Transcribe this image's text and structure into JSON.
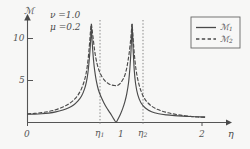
{
  "figure": {
    "background_color": "#f7f7f6",
    "ink_color": "#4a4a4a"
  },
  "annotations": {
    "param_nu": "ν =1.0",
    "param_mu": "μ =0.2"
  },
  "axes": {
    "y_axis_label": "ℳ",
    "x_axis_label": "η",
    "x_tick_labels": [
      "0",
      "η",
      "1",
      "η",
      "2"
    ],
    "x_tick_subs": [
      "",
      "1",
      "",
      "2",
      ""
    ],
    "y_tick_labels": [
      "5",
      "10"
    ]
  },
  "legend": {
    "entries": [
      {
        "label": "ℳ",
        "sub": "1",
        "style": "solid"
      },
      {
        "label": "ℳ",
        "sub": "2",
        "style": "dashed"
      }
    ]
  },
  "chart_data": {
    "type": "line",
    "title": "",
    "xlabel": "η",
    "ylabel": "ℳ",
    "xlim": [
      0,
      2.15
    ],
    "ylim": [
      0,
      13.5
    ],
    "grid": false,
    "legend_position": "top-right",
    "parameters": {
      "nu": 1.0,
      "mu": 0.2
    },
    "x_ticks": [
      {
        "value": 0,
        "label": "0"
      },
      {
        "value": 0.72,
        "label": "η₁"
      },
      {
        "value": 1.0,
        "label": "1"
      },
      {
        "value": 1.18,
        "label": "η₂"
      },
      {
        "value": 2.0,
        "label": "2"
      }
    ],
    "y_ticks": [
      {
        "value": 5,
        "label": "5"
      },
      {
        "value": 10,
        "label": "10"
      }
    ],
    "resonance_lines": [
      {
        "name": "eta1",
        "x": 0.72,
        "style": "dotted"
      },
      {
        "name": "eta2",
        "x": 1.18,
        "style": "dotted"
      }
    ],
    "annotations": [
      {
        "text": "ν =1.0",
        "x": 0.22,
        "y": 12.4
      },
      {
        "text": "μ =0.2",
        "x": 0.22,
        "y": 11.2
      }
    ],
    "series": [
      {
        "name": "ℳ1",
        "style": "solid",
        "x": [
          0.0,
          0.08,
          0.16,
          0.24,
          0.32,
          0.4,
          0.46,
          0.52,
          0.57,
          0.61,
          0.645,
          0.665,
          0.682,
          0.695,
          0.705,
          0.712,
          0.717,
          0.72,
          0.723,
          0.728,
          0.735,
          0.745,
          0.758,
          0.775,
          0.8,
          0.83,
          0.86,
          0.89,
          0.92,
          0.95,
          0.975,
          1.0,
          1.025,
          1.05,
          1.075,
          1.1,
          1.12,
          1.14,
          1.155,
          1.168,
          1.176,
          1.18,
          1.185,
          1.193,
          1.205,
          1.22,
          1.245,
          1.28,
          1.33,
          1.4,
          1.48,
          1.57,
          1.66,
          1.75,
          1.84,
          1.92,
          2.0
        ],
        "y": [
          1.1,
          1.12,
          1.17,
          1.26,
          1.42,
          1.68,
          1.95,
          2.35,
          2.9,
          3.55,
          4.55,
          5.45,
          6.7,
          8.2,
          9.6,
          11.0,
          12.2,
          13.2,
          12.4,
          11.2,
          9.9,
          8.4,
          7.0,
          5.7,
          4.4,
          3.45,
          2.7,
          2.05,
          1.5,
          0.95,
          0.45,
          0.05,
          0.55,
          1.15,
          1.9,
          2.85,
          3.85,
          5.3,
          7.2,
          9.6,
          11.8,
          13.2,
          12.0,
          9.6,
          7.0,
          5.2,
          3.7,
          2.65,
          1.95,
          1.45,
          1.18,
          1.02,
          0.92,
          0.85,
          0.8,
          0.77,
          0.75
        ]
      },
      {
        "name": "ℳ2",
        "style": "dashed",
        "x": [
          0.0,
          0.08,
          0.16,
          0.24,
          0.32,
          0.4,
          0.46,
          0.52,
          0.57,
          0.61,
          0.64,
          0.66,
          0.675,
          0.688,
          0.698,
          0.706,
          0.712,
          0.72,
          0.728,
          0.738,
          0.75,
          0.765,
          0.785,
          0.81,
          0.84,
          0.875,
          0.91,
          0.945,
          0.975,
          1.0,
          1.025,
          1.05,
          1.078,
          1.1,
          1.118,
          1.132,
          1.145,
          1.157,
          1.167,
          1.175,
          1.18,
          1.186,
          1.195,
          1.208,
          1.225,
          1.25,
          1.285,
          1.33,
          1.4,
          1.48,
          1.57,
          1.66,
          1.75,
          1.84,
          1.92,
          2.0
        ],
        "y": [
          1.18,
          1.22,
          1.32,
          1.48,
          1.72,
          2.08,
          2.45,
          3.0,
          3.7,
          4.55,
          5.55,
          6.5,
          7.6,
          8.95,
          10.3,
          11.5,
          12.4,
          13.2,
          12.6,
          11.6,
          10.4,
          9.1,
          7.9,
          6.9,
          6.15,
          5.6,
          5.25,
          5.05,
          4.98,
          4.95,
          5.05,
          5.3,
          5.8,
          6.4,
          7.2,
          8.1,
          9.1,
          10.3,
          11.5,
          12.6,
          13.2,
          12.4,
          10.8,
          8.9,
          7.1,
          5.5,
          4.1,
          3.05,
          2.2,
          1.7,
          1.35,
          1.12,
          0.95,
          0.82,
          0.74,
          0.68
        ]
      }
    ]
  }
}
